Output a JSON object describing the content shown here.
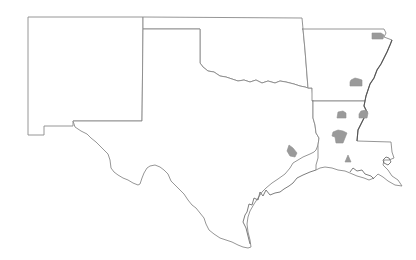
{
  "map": {
    "region": "South Central United States",
    "states": [
      {
        "name": "New Mexico",
        "abbr": "NM"
      },
      {
        "name": "Texas",
        "abbr": "TX"
      },
      {
        "name": "Oklahoma",
        "abbr": "OK"
      },
      {
        "name": "Arkansas",
        "abbr": "AR"
      },
      {
        "name": "Louisiana",
        "abbr": "LA"
      }
    ],
    "colors": {
      "background": "#ffffff",
      "boundary": "#8a8a8a",
      "highlight_fill": "#9a9a9a"
    },
    "highlighted_areas": [
      {
        "id": "area-ne-arkansas",
        "state": "Arkansas",
        "location": "northeast"
      },
      {
        "id": "area-central-arkansas",
        "state": "Arkansas",
        "location": "central"
      },
      {
        "id": "area-north-louisiana-west",
        "state": "Louisiana",
        "location": "north-west"
      },
      {
        "id": "area-north-louisiana-east",
        "state": "Louisiana",
        "location": "north-east"
      },
      {
        "id": "area-central-louisiana",
        "state": "Louisiana",
        "location": "central"
      },
      {
        "id": "area-south-louisiana",
        "state": "Louisiana",
        "location": "south"
      },
      {
        "id": "area-east-texas",
        "state": "Texas",
        "location": "east"
      }
    ]
  }
}
